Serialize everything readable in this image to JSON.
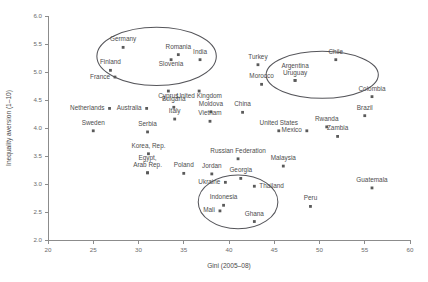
{
  "chart_data": {
    "type": "scatter",
    "title": "",
    "xlabel": "Gini (2005–08)",
    "ylabel": "Inequality aversion (1–10)",
    "xlim": [
      20,
      60
    ],
    "ylim": [
      2.0,
      6.0
    ],
    "xticks": [
      20,
      25,
      30,
      35,
      40,
      45,
      50,
      55,
      60
    ],
    "yticks": [
      "2.0",
      "2.5",
      "3.0",
      "3.5",
      "4.0",
      "4.5",
      "5.0",
      "5.5",
      "6.0"
    ],
    "grid": false,
    "legend": "none",
    "marker_color": "#5a5a5a",
    "annotation_color": "#55555a",
    "points": [
      {
        "label": "Germany",
        "x": 28.3,
        "y": 5.44,
        "label_dx": 0,
        "label_dy": -6,
        "anchor": "middle"
      },
      {
        "label": "Romania",
        "x": 34.4,
        "y": 5.31,
        "label_dx": 0,
        "label_dy": -6,
        "anchor": "middle"
      },
      {
        "label": "India",
        "x": 36.8,
        "y": 5.22,
        "label_dx": 0,
        "label_dy": -6,
        "anchor": "middle"
      },
      {
        "label": "Slovenia",
        "x": 33.6,
        "y": 5.22,
        "label_dx": 0,
        "label_dy": 6.5,
        "anchor": "middle"
      },
      {
        "label": "Finland",
        "x": 26.9,
        "y": 5.03,
        "label_dx": 0,
        "label_dy": -6,
        "anchor": "middle"
      },
      {
        "label": "France",
        "x": 27.4,
        "y": 4.91,
        "label_dx": -5,
        "label_dy": 2.2,
        "anchor": "end"
      },
      {
        "label": "Turkey",
        "x": 43.2,
        "y": 5.13,
        "label_dx": 0,
        "label_dy": -6,
        "anchor": "middle"
      },
      {
        "label": "Chile",
        "x": 51.8,
        "y": 5.22,
        "label_dx": 0,
        "label_dy": -6,
        "anchor": "middle"
      },
      {
        "label": "Argentina",
        "x": 47.3,
        "y": 4.85,
        "label_dx": 0,
        "label_dy": -12.5,
        "anchor": "middle"
      },
      {
        "label": "Uruguay",
        "x": 47.3,
        "y": 4.85,
        "label_dx": 0,
        "label_dy": -5.5,
        "anchor": "middle"
      },
      {
        "label": "Morocco",
        "x": 43.6,
        "y": 4.78,
        "label_dx": 0,
        "label_dy": -6,
        "anchor": "middle"
      },
      {
        "label": "Cyprus",
        "x": 33.3,
        "y": 4.66,
        "label_dx": 0,
        "label_dy": 6.5,
        "anchor": "middle"
      },
      {
        "label": "United Kingdom",
        "x": 36.7,
        "y": 4.66,
        "label_dx": 0,
        "label_dy": 6.5,
        "anchor": "middle"
      },
      {
        "label": "Colombia",
        "x": 55.8,
        "y": 4.56,
        "label_dx": 0,
        "label_dy": -6,
        "anchor": "middle"
      },
      {
        "label": "Bulgaria",
        "x": 33.9,
        "y": 4.37,
        "label_dx": 0,
        "label_dy": -6,
        "anchor": "middle"
      },
      {
        "label": "Netherlands",
        "x": 26.8,
        "y": 4.35,
        "label_dx": -5,
        "label_dy": 1.5,
        "anchor": "end"
      },
      {
        "label": "Australia",
        "x": 30.9,
        "y": 4.35,
        "label_dx": -5,
        "label_dy": 1.5,
        "anchor": "end"
      },
      {
        "label": "Moldova",
        "x": 38.0,
        "y": 4.29,
        "label_dx": 0,
        "label_dy": -6,
        "anchor": "middle"
      },
      {
        "label": "Brazil",
        "x": 55.0,
        "y": 4.22,
        "label_dx": 0,
        "label_dy": -6,
        "anchor": "middle"
      },
      {
        "label": "China",
        "x": 41.5,
        "y": 4.28,
        "label_dx": 0,
        "label_dy": -6,
        "anchor": "middle"
      },
      {
        "label": "Italy",
        "x": 34.0,
        "y": 4.16,
        "label_dx": 0,
        "label_dy": -6,
        "anchor": "middle"
      },
      {
        "label": "Vietnam",
        "x": 37.9,
        "y": 4.12,
        "label_dx": 0,
        "label_dy": -6,
        "anchor": "middle"
      },
      {
        "label": "Rwanda",
        "x": 50.8,
        "y": 4.02,
        "label_dx": 0,
        "label_dy": -6,
        "anchor": "middle"
      },
      {
        "label": "Sweden",
        "x": 25.0,
        "y": 3.95,
        "label_dx": 0,
        "label_dy": -6,
        "anchor": "middle"
      },
      {
        "label": "Serbia",
        "x": 31.0,
        "y": 3.93,
        "label_dx": 0,
        "label_dy": -6,
        "anchor": "middle"
      },
      {
        "label": "United States",
        "x": 45.5,
        "y": 3.95,
        "label_dx": 0,
        "label_dy": -6,
        "anchor": "middle"
      },
      {
        "label": "Mexico",
        "x": 48.6,
        "y": 3.95,
        "label_dx": -5,
        "label_dy": 1.5,
        "anchor": "end"
      },
      {
        "label": "Zambia",
        "x": 52.0,
        "y": 3.85,
        "label_dx": 0,
        "label_dy": -6,
        "anchor": "middle"
      },
      {
        "label": "Korea, Rep.",
        "x": 31.1,
        "y": 3.54,
        "label_dx": 0,
        "label_dy": -6,
        "anchor": "middle"
      },
      {
        "label": "Russian Federation",
        "x": 41.0,
        "y": 3.45,
        "label_dx": 0,
        "label_dy": -6,
        "anchor": "middle"
      },
      {
        "label": "Malaysia",
        "x": 46.0,
        "y": 3.32,
        "label_dx": 0,
        "label_dy": -6,
        "anchor": "middle"
      },
      {
        "label": "Egypt,",
        "x": 31.0,
        "y": 3.2,
        "label_dx": 0,
        "label_dy": -12.5,
        "anchor": "middle"
      },
      {
        "label": "Arab Rep.",
        "x": 31.0,
        "y": 3.2,
        "label_dx": 0,
        "label_dy": -5.5,
        "anchor": "middle"
      },
      {
        "label": "Poland",
        "x": 35.0,
        "y": 3.19,
        "label_dx": 0,
        "label_dy": -6,
        "anchor": "middle"
      },
      {
        "label": "Jordan",
        "x": 38.1,
        "y": 3.18,
        "label_dx": 0,
        "label_dy": -6,
        "anchor": "middle"
      },
      {
        "label": "Georgia",
        "x": 41.3,
        "y": 3.1,
        "label_dx": 0,
        "label_dy": -6,
        "anchor": "middle"
      },
      {
        "label": "Ukraine",
        "x": 39.6,
        "y": 3.03,
        "label_dx": -5,
        "label_dy": 1.5,
        "anchor": "end"
      },
      {
        "label": "Thailand",
        "x": 42.8,
        "y": 2.96,
        "label_dx": 5,
        "label_dy": 1.5,
        "anchor": "start"
      },
      {
        "label": "Guatemala",
        "x": 55.8,
        "y": 2.93,
        "label_dx": 0,
        "label_dy": -6,
        "anchor": "middle"
      },
      {
        "label": "Indonesia",
        "x": 39.4,
        "y": 2.62,
        "label_dx": 0,
        "label_dy": -6,
        "anchor": "middle"
      },
      {
        "label": "Mali",
        "x": 39.0,
        "y": 2.52,
        "label_dx": -5,
        "label_dy": 1.5,
        "anchor": "end"
      },
      {
        "label": "Peru",
        "x": 49.0,
        "y": 2.6,
        "label_dx": 0,
        "label_dy": -6,
        "anchor": "middle"
      },
      {
        "label": "Ghana",
        "x": 42.8,
        "y": 2.33,
        "label_dx": 0,
        "label_dy": -6,
        "anchor": "middle"
      }
    ],
    "ellipses": [
      {
        "name": "high-aversion-cluster",
        "cx": 32.0,
        "cy": 5.28,
        "rx": 6.6,
        "ry": 0.52,
        "rotation": 0
      },
      {
        "name": "latin-america-cluster",
        "cx": 50.3,
        "cy": 4.95,
        "rx": 6.2,
        "ry": 0.42,
        "rotation": 0
      },
      {
        "name": "low-aversion-cluster",
        "cx": 41.0,
        "cy": 2.68,
        "rx": 4.4,
        "ry": 0.48,
        "rotation": 0
      }
    ]
  }
}
